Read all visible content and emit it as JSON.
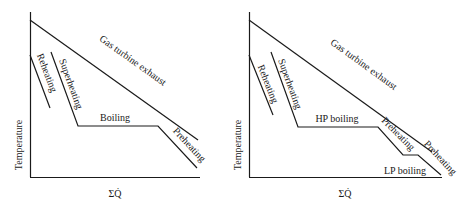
{
  "left_diagram": {
    "y_axis_label": "Temperature",
    "x_axis_label": "ΣQ̇",
    "labels": {
      "gas": "Gas turbine exhaust",
      "reheating": "Reheating",
      "superheating": "Superheating",
      "boiling": "Boiling",
      "preheating": "Preheating"
    }
  },
  "right_diagram": {
    "y_axis_label": "Temperature",
    "x_axis_label": "ΣQ̇",
    "labels": {
      "gas": "Gas turbine exhaust",
      "reheating": "Reheating",
      "superheating": "Superheating",
      "hp_boiling": "HP boiling",
      "preheating_hp": "Preheating",
      "lp_boiling": "LP boiling",
      "preheating_lp": "Preheating"
    }
  }
}
